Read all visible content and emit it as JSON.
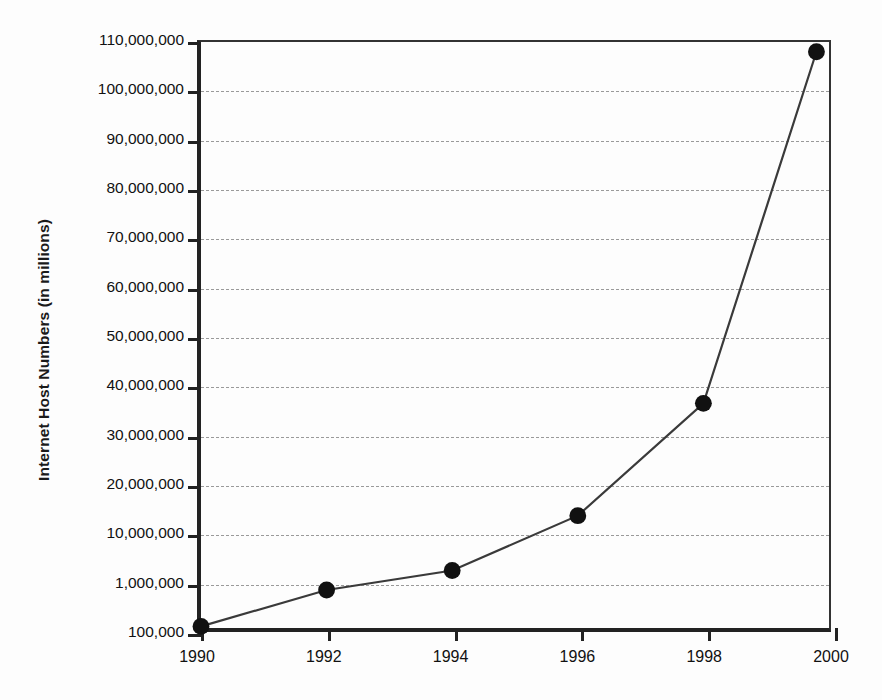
{
  "chart_data": {
    "type": "line",
    "title": "",
    "subtitle": "",
    "xlabel": "",
    "ylabel": "Internet Host Numbers (in millions)",
    "grid": true,
    "legend": false,
    "x": [
      1990,
      1992,
      1994,
      1996,
      1998,
      1999.8
    ],
    "values": [
      130000,
      800000,
      2600000,
      13000000,
      36000000,
      108000000
    ],
    "series": [
      {
        "name": "Internet Hosts",
        "values": [
          130000,
          800000,
          2600000,
          13000000,
          36000000,
          108000000
        ]
      }
    ],
    "x_tick_labels": [
      "1990",
      "1992",
      "1994",
      "1996",
      "1998",
      "2000"
    ],
    "x_tick_values": [
      1990,
      1992,
      1994,
      1996,
      1998,
      2000
    ],
    "xlim": [
      1990,
      2000
    ],
    "y_tick_labels": [
      "110,000,000",
      "100,000,000",
      "90,000,000",
      "80,000,000",
      "70,000,000",
      "60,000,000",
      "50,000,000",
      "40,000,000",
      "30,000,000",
      "20,000,000",
      "10,000,000",
      "1,000,000",
      "100,000"
    ],
    "y_tick_values": [
      110000000,
      100000000,
      90000000,
      80000000,
      70000000,
      60000000,
      50000000,
      40000000,
      30000000,
      20000000,
      10000000,
      1000000,
      100000
    ],
    "y_axis_note": "Irregular axis: evenly spaced ticks, linear 10M-110M, then 1,000,000 and 100,000 below",
    "ylim": [
      100000,
      110000000
    ],
    "colors": {
      "line": "#3a3a3a",
      "marker": "#111111",
      "grid": "#9a9a9a",
      "axis": "#222222",
      "background": "#fdfdfd"
    }
  }
}
